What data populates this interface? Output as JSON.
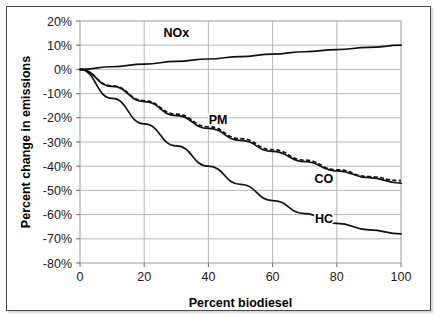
{
  "chart_data": {
    "type": "line",
    "title": "",
    "xlabel": "Percent biodiesel",
    "ylabel": "Percent change in emissions",
    "xlim": [
      0,
      100
    ],
    "ylim": [
      -80,
      20
    ],
    "xticks": [
      "0",
      "20",
      "40",
      "60",
      "80",
      "100"
    ],
    "xtick_values": [
      0,
      20,
      40,
      60,
      80,
      100
    ],
    "yticks": [
      "20%",
      "10%",
      "0%",
      "-10%",
      "-20%",
      "-30%",
      "-40%",
      "-50%",
      "-60%",
      "-70%",
      "-80%"
    ],
    "ytick_values": [
      20,
      10,
      0,
      -10,
      -20,
      -30,
      -40,
      -50,
      -60,
      -70,
      -80
    ],
    "grid": true,
    "legend_position": "inline-labels",
    "x": [
      0,
      10,
      20,
      30,
      40,
      50,
      60,
      70,
      80,
      90,
      100
    ],
    "series": [
      {
        "name": "NOx",
        "style": "solid",
        "label_x": 30,
        "label_y": 13.5,
        "values": [
          0,
          1.1,
          2.2,
          3.3,
          4.3,
          5.3,
          6.3,
          7.3,
          8.2,
          9.1,
          10.0
        ]
      },
      {
        "name": "PM",
        "style": "dashed",
        "label_x": 43,
        "label_y": -22.5,
        "values": [
          0,
          -6.8,
          -12.9,
          -18.5,
          -23.7,
          -28.6,
          -33.2,
          -37.5,
          -41.5,
          -44.3,
          -46.0
        ]
      },
      {
        "name": "CO",
        "style": "solid",
        "label_x": 76,
        "label_y": -47.0,
        "values": [
          0,
          -7.0,
          -13.3,
          -19.1,
          -24.4,
          -29.3,
          -33.9,
          -38.1,
          -41.9,
          -44.7,
          -47.0
        ]
      },
      {
        "name": "HC",
        "style": "solid",
        "label_x": 76,
        "label_y": -63.5,
        "values": [
          0,
          -12.0,
          -22.5,
          -31.6,
          -40.0,
          -47.5,
          -54.2,
          -59.6,
          -63.6,
          -66.3,
          -68.0
        ]
      }
    ],
    "colors": {
      "line": "#111111",
      "grid": "#a6a6a6",
      "plot_border": "#9b9b9b",
      "frame_border": "#4a4a4a",
      "text": "#1a1a1a",
      "background": "#ffffff"
    }
  }
}
